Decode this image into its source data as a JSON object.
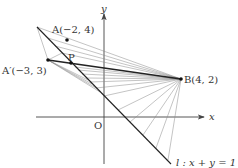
{
  "diagram": {
    "origin_label": "O",
    "x_axis_label": "x",
    "y_axis_label": "y",
    "points": {
      "A": {
        "label": "A(−2, 4)",
        "x": -2,
        "y": 4
      },
      "A_prime": {
        "label": "A′(−3, 3)",
        "x": -3,
        "y": 3
      },
      "B": {
        "label": "B(4, 2)",
        "x": 4,
        "y": 2
      },
      "P": {
        "label": "P"
      }
    },
    "line_l": {
      "label": "l : x + y = 1"
    },
    "colors": {
      "axis": "#444444",
      "bold_line": "#222222",
      "thin_line": "#888888"
    }
  }
}
